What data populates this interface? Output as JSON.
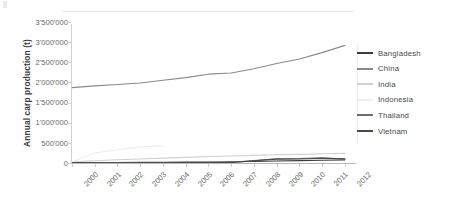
{
  "chart_data": {
    "type": "line",
    "title": "",
    "xlabel": "",
    "ylabel": "Annual carp production (t)",
    "x": [
      2000,
      2001,
      2002,
      2003,
      2004,
      2005,
      2006,
      2007,
      2008,
      2009,
      2010,
      2011,
      2012
    ],
    "xlim": [
      2000,
      2012.4
    ],
    "ylim": [
      0,
      3500000
    ],
    "yticks": [
      0,
      500000,
      1000000,
      1500000,
      2000000,
      2500000,
      3000000,
      3500000
    ],
    "ytick_labels": [
      "0",
      "500'000",
      "1'000'000",
      "1'500'000",
      "2'000'000",
      "2'500'000",
      "3'000'000",
      "3'500'000"
    ],
    "xtick_labels": [
      "2000",
      "2001",
      "2002",
      "2003",
      "2004",
      "2005",
      "2006",
      "2007",
      "2008",
      "2009",
      "2010",
      "2011",
      "2012"
    ],
    "grid": false,
    "legend_position": "right",
    "series": [
      {
        "name": "Bangladesh",
        "color": "#3d3d3d",
        "values": [
          9000,
          11000,
          13000,
          15000,
          18000,
          21000,
          25000,
          30000,
          38000,
          48000,
          58000,
          68000,
          78000
        ]
      },
      {
        "name": "China",
        "color": "#8a8a8a",
        "values": [
          1870000,
          1915000,
          1950000,
          1985000,
          2055000,
          2120000,
          2205000,
          2235000,
          2340000,
          2470000,
          2580000,
          2740000,
          2920000
        ]
      },
      {
        "name": "India",
        "color": "#d0d0d0",
        "values": [
          30000,
          55000,
          80000,
          100000,
          120000,
          140000,
          160000,
          175000,
          190000,
          205000,
          215000,
          230000,
          240000
        ]
      },
      {
        "name": "Indonesia",
        "color": "#ededed",
        "values": [
          25000,
          250000,
          330000,
          400000,
          430000,
          null,
          null,
          null,
          null,
          null,
          null,
          null,
          null
        ]
      },
      {
        "name": "Thailand",
        "color": "#6e6e6e",
        "values": [
          5000,
          6000,
          7000,
          8000,
          9000,
          11000,
          13000,
          16000,
          60000,
          105000,
          110000,
          130000,
          95000
        ]
      },
      {
        "name": "Vietnam",
        "color": "#4a4a4a",
        "values": [
          4000,
          5000,
          6000,
          7000,
          8000,
          9000,
          11000,
          13000,
          55000,
          95000,
          98000,
          118000,
          105000
        ]
      }
    ]
  },
  "legend": {
    "items": [
      {
        "label": "Bangladesh",
        "color": "#3d3d3d"
      },
      {
        "label": "China",
        "color": "#8a8a8a"
      },
      {
        "label": "India",
        "color": "#d0d0d0"
      },
      {
        "label": "Indonesia",
        "color": "#f0f0f0"
      },
      {
        "label": "Thailand",
        "color": "#6e6e6e"
      },
      {
        "label": "Vietnam",
        "color": "#4a4a4a"
      }
    ]
  },
  "axis": {
    "y_title": "Annual carp production (t)"
  }
}
